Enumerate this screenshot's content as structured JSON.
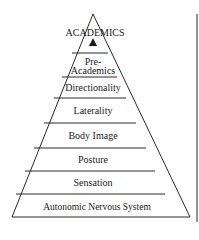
{
  "diagram": {
    "type": "pyramid",
    "apex_label": "ACADEMICS",
    "apex_marker": "triangle-up",
    "levels_top_to_bottom": [
      {
        "line1": "Pre-",
        "line2": "Academics"
      },
      {
        "label": "Directionality"
      },
      {
        "label": "Laterality"
      },
      {
        "label": "Body Image"
      },
      {
        "label": "Posture"
      },
      {
        "label": "Sensation"
      },
      {
        "label": "Autonomic Nervous System"
      }
    ],
    "colors": {
      "line": "#2a2a2a",
      "text": "#1a1a1a",
      "background": "#ffffff"
    }
  }
}
